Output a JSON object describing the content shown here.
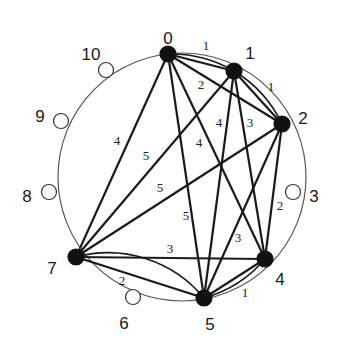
{
  "diagram": {
    "type": "graph",
    "circle": {
      "cx": 182,
      "cy": 177,
      "r": 124
    },
    "colors": {
      "edge": "#1a1a1a",
      "filled_node": "#111111",
      "open_node_fill": "#ffffff",
      "circle": "#555555"
    },
    "nodes": [
      {
        "id": "0",
        "label": "0",
        "x": 168,
        "y": 54,
        "filled": true,
        "lx": 168,
        "ly": 40
      },
      {
        "id": "1",
        "label": "1",
        "x": 234,
        "y": 71,
        "filled": true,
        "lx": 250,
        "ly": 55
      },
      {
        "id": "2",
        "label": "2",
        "x": 282,
        "y": 124,
        "filled": true,
        "lx": 303,
        "ly": 120
      },
      {
        "id": "3",
        "label": "3",
        "x": 293,
        "y": 192,
        "filled": false,
        "lx": 314,
        "ly": 198
      },
      {
        "id": "4",
        "label": "4",
        "x": 265,
        "y": 259,
        "filled": true,
        "lx": 280,
        "ly": 281
      },
      {
        "id": "5",
        "label": "5",
        "x": 204,
        "y": 298,
        "filled": true,
        "lx": 210,
        "ly": 326
      },
      {
        "id": "6",
        "label": "6",
        "x": 133,
        "y": 297,
        "filled": false,
        "lx": 124,
        "ly": 325
      },
      {
        "id": "7",
        "label": "7",
        "x": 76,
        "y": 257,
        "filled": true,
        "lx": 52,
        "ly": 270
      },
      {
        "id": "8",
        "label": "8",
        "x": 49,
        "y": 192,
        "filled": false,
        "lx": 27,
        "ly": 198
      },
      {
        "id": "9",
        "label": "9",
        "x": 61,
        "y": 121,
        "filled": false,
        "lx": 40,
        "ly": 118
      },
      {
        "id": "10",
        "label": "10",
        "x": 106,
        "y": 70,
        "filled": false,
        "lx": 91,
        "ly": 56
      }
    ],
    "edges": [
      {
        "from": "0",
        "to": "1",
        "weight": "1",
        "arc": true,
        "wx": 206,
        "wy": 50
      },
      {
        "from": "1",
        "to": "2",
        "weight": "1",
        "arc": true,
        "wx": 271,
        "wy": 91
      },
      {
        "from": "0",
        "to": "2",
        "weight": "2",
        "wx": 201,
        "wy": 89
      },
      {
        "from": "0",
        "to": "7",
        "weight": "4",
        "wx": 117,
        "wy": 145
      },
      {
        "from": "0",
        "to": "5",
        "weight": "5",
        "wx": 186,
        "wy": 220
      },
      {
        "from": "0",
        "to": "4",
        "weight": "4",
        "wx": 199,
        "wy": 147
      },
      {
        "from": "1",
        "to": "7",
        "weight": "5",
        "wx": 146,
        "wy": 160
      },
      {
        "from": "1",
        "to": "5",
        "weight": "4",
        "wx": 219,
        "wy": 127
      },
      {
        "from": "1",
        "to": "4",
        "weight": "3",
        "wx": 250,
        "wy": 127
      },
      {
        "from": "2",
        "to": "7",
        "weight": "5",
        "wx": 160,
        "wy": 192
      },
      {
        "from": "2",
        "to": "5",
        "weight": "3",
        "wx": 238,
        "wy": 242
      },
      {
        "from": "2",
        "to": "4",
        "weight": "2",
        "wx": 280,
        "wy": 210
      },
      {
        "from": "7",
        "to": "4",
        "weight": "3",
        "wx": 170,
        "wy": 253
      },
      {
        "from": "7",
        "to": "5",
        "weight": "2",
        "arc_through": "6",
        "wx": 122,
        "wy": 285
      },
      {
        "from": "4",
        "to": "5",
        "weight": "1",
        "arc": true,
        "wx": 245,
        "wy": 297
      }
    ]
  }
}
